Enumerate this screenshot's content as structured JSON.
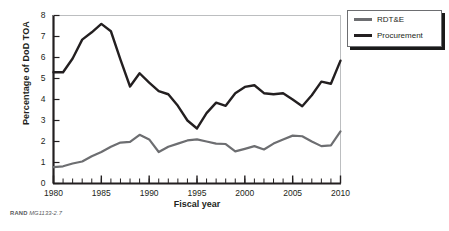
{
  "figure": {
    "credit_brand": "RAND",
    "credit_id": "MG1133-2.7"
  },
  "legend": {
    "position": "top-right",
    "items": [
      {
        "label": "RDT&E",
        "color": "#6d6e71"
      },
      {
        "label": "Procurement",
        "color": "#231f20"
      }
    ]
  },
  "chart_data": {
    "type": "line",
    "title": "",
    "xlabel": "Fiscal year",
    "ylabel": "Percentage of DoD TOA",
    "xlim": [
      1980,
      2010
    ],
    "ylim": [
      0,
      8
    ],
    "xticks": [
      1980,
      1985,
      1990,
      1995,
      2000,
      2005,
      2010
    ],
    "xtick_labels": [
      "1980",
      "1985",
      "1990",
      "1995",
      "2000",
      "2005",
      "2010"
    ],
    "xminor_tick_step": 1,
    "yticks": [
      0,
      1,
      2,
      3,
      4,
      5,
      6,
      7,
      8
    ],
    "ytick_labels": [
      "0",
      "1",
      "2",
      "3",
      "4",
      "5",
      "6",
      "7",
      "8"
    ],
    "grid": false,
    "legend_position": "top-right",
    "x": [
      1980,
      1981,
      1982,
      1983,
      1984,
      1985,
      1986,
      1987,
      1988,
      1989,
      1990,
      1991,
      1992,
      1993,
      1994,
      1995,
      1996,
      1997,
      1998,
      1999,
      2000,
      2001,
      2002,
      2003,
      2004,
      2005,
      2006,
      2007,
      2008,
      2009,
      2010
    ],
    "series": [
      {
        "name": "RDT&E",
        "color": "#6d6e71",
        "values": [
          0.78,
          0.82,
          0.95,
          1.05,
          1.3,
          1.5,
          1.75,
          1.95,
          1.98,
          2.32,
          2.1,
          1.5,
          1.75,
          1.9,
          2.05,
          2.1,
          2.0,
          1.9,
          1.88,
          1.53,
          1.65,
          1.78,
          1.62,
          1.9,
          2.1,
          2.28,
          2.25,
          2.0,
          1.78,
          1.82,
          2.48
        ]
      },
      {
        "name": "Procurement",
        "color": "#231f20",
        "values": [
          5.3,
          5.3,
          5.95,
          6.85,
          7.2,
          7.6,
          7.25,
          5.9,
          4.62,
          5.25,
          4.8,
          4.4,
          4.25,
          3.7,
          3.0,
          2.62,
          3.35,
          3.85,
          3.7,
          4.3,
          4.6,
          4.68,
          4.3,
          4.25,
          4.3,
          4.0,
          3.68,
          4.2,
          4.85,
          4.75,
          5.85
        ]
      }
    ]
  }
}
